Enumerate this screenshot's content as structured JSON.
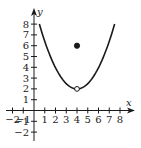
{
  "chart_data": {
    "type": "line",
    "title": "",
    "xlabel": "x",
    "ylabel": "y",
    "xlim": [
      -2.5,
      8.8
    ],
    "ylim": [
      -2.8,
      9
    ],
    "grid": false,
    "x_ticks": [
      -2,
      -1,
      1,
      2,
      3,
      4,
      5,
      6,
      7,
      8
    ],
    "x_tick_labels": [
      "−2",
      "−1",
      "1",
      "2",
      "3",
      "4",
      "5",
      "6",
      "7",
      "8"
    ],
    "y_ticks": [
      -2,
      -1,
      1,
      2,
      3,
      4,
      5,
      6,
      7,
      8
    ],
    "y_tick_labels": [
      "−2",
      "−1",
      "1",
      "2",
      "3",
      "4",
      "5",
      "6",
      "7",
      "8"
    ],
    "series": [
      {
        "name": "parabola",
        "description": "U-shaped curve with vertex at (4, 2), from x=0.5 to x=7.5",
        "equation_approx": "y = 2 + 0.49(x − 4)^2",
        "x": [
          0.5,
          1,
          1.5,
          2,
          2.5,
          3,
          3.5,
          4,
          4.5,
          5,
          5.5,
          6,
          6.5,
          7,
          7.5
        ],
        "y": [
          8,
          6.41,
          5.06,
          3.96,
          3.1,
          2.49,
          2.12,
          2,
          2.12,
          2.49,
          3.1,
          3.96,
          5.06,
          6.41,
          8
        ]
      }
    ],
    "points": [
      {
        "name": "open-circle",
        "x": 4,
        "y": 2,
        "filled": false
      },
      {
        "name": "filled-dot",
        "x": 4,
        "y": 6,
        "filled": true
      }
    ]
  },
  "labels": {
    "x_axis": "x",
    "y_axis": "y"
  },
  "colors": {
    "ink": "#1a1a1a",
    "background": "#ffffff"
  }
}
